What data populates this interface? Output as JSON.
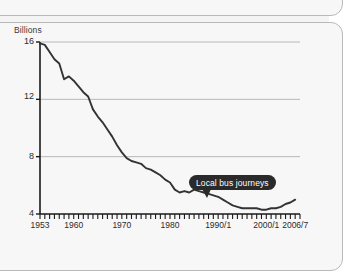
{
  "chart_data": {
    "type": "line",
    "title": "",
    "subtitle": "",
    "xlabel": "",
    "ylabel": "Billions",
    "ylim": [
      4,
      16
    ],
    "xlim": [
      1953,
      2007
    ],
    "grid": true,
    "gridlines_y": [
      8,
      12,
      16
    ],
    "legend_position": "none",
    "ytick_labels": [
      "16",
      "12",
      "8",
      "4"
    ],
    "ytick_values": [
      16,
      12,
      8,
      4
    ],
    "xtick_labels": [
      "1953",
      "1960",
      "1970",
      "1980",
      "1990/1",
      "2000/1",
      "2006/7"
    ],
    "xtick_values": [
      1953,
      1960,
      1970,
      1980,
      1990,
      2000,
      2006
    ],
    "xtick_minor_step_years": 1,
    "annotations": [
      {
        "text": "Local bus journeys",
        "points_to_x": 1985,
        "points_to_y": 5.7
      }
    ],
    "series": [
      {
        "name": "Local bus journeys",
        "color": "#333333",
        "x": [
          1953,
          1954,
          1955,
          1956,
          1957,
          1958,
          1959,
          1960,
          1961,
          1962,
          1963,
          1964,
          1965,
          1966,
          1967,
          1968,
          1969,
          1970,
          1971,
          1972,
          1973,
          1974,
          1975,
          1976,
          1977,
          1978,
          1979,
          1980,
          1981,
          1982,
          1983,
          1984,
          1985,
          1986,
          1987,
          1988,
          1989,
          1990,
          1991,
          1992,
          1993,
          1994,
          1995,
          1996,
          1997,
          1998,
          1999,
          2000,
          2001,
          2002,
          2003,
          2004,
          2005,
          2006
        ],
        "values": [
          15.9,
          15.8,
          15.3,
          14.8,
          14.5,
          13.4,
          13.6,
          13.3,
          12.9,
          12.5,
          12.2,
          11.3,
          10.8,
          10.4,
          9.9,
          9.4,
          8.8,
          8.3,
          7.9,
          7.7,
          7.6,
          7.5,
          7.2,
          7.1,
          6.9,
          6.7,
          6.4,
          6.2,
          5.7,
          5.5,
          5.6,
          5.5,
          5.7,
          5.6,
          5.5,
          5.4,
          5.3,
          5.2,
          5.0,
          4.8,
          4.6,
          4.5,
          4.4,
          4.4,
          4.4,
          4.4,
          4.3,
          4.3,
          4.4,
          4.4,
          4.5,
          4.7,
          4.8,
          5.0
        ]
      }
    ]
  },
  "chart": {
    "y_axis_title": "Billions"
  }
}
